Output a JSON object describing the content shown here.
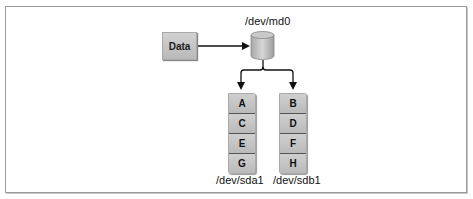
{
  "diagram": {
    "type": "RAID 0 striping",
    "source": {
      "label": "Data"
    },
    "array_device": {
      "label": "/dev/md0"
    },
    "disks": [
      {
        "label": "/dev/sda1",
        "blocks": [
          "A",
          "C",
          "E",
          "G"
        ]
      },
      {
        "label": "/dev/sdb1",
        "blocks": [
          "B",
          "D",
          "F",
          "H"
        ]
      }
    ],
    "colors": {
      "box_fill": "#c4c4c4",
      "border": "#9a9a9a",
      "line": "#111111"
    }
  }
}
